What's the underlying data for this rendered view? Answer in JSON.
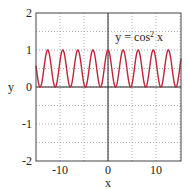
{
  "chart_data": {
    "type": "line",
    "title": "",
    "xlabel": "x",
    "ylabel": "y",
    "xlim": [
      -15,
      15.2
    ],
    "ylim": [
      -2,
      2
    ],
    "grid": true,
    "xticks": [
      -10,
      0,
      10
    ],
    "xtick_labels": [
      "-10",
      "0",
      "10"
    ],
    "xminor_ticks": [
      -15,
      -5,
      5,
      15
    ],
    "yticks": [
      -2,
      -1,
      0,
      1,
      2
    ],
    "ytick_labels": [
      "-2",
      "-1",
      "0",
      "1",
      "2"
    ],
    "yminor_ticks": [
      -1.5,
      -0.5,
      0.5,
      1.5
    ],
    "series": [
      {
        "name": "y = cos² x",
        "function": "cos(x)^2",
        "color": "#c0243a",
        "x_range": [
          -15,
          15.2
        ],
        "min": 0,
        "max": 1,
        "period": 3.14159
      }
    ],
    "annotations": [
      {
        "text": "y = cos² x",
        "x": 6.5,
        "y": 1.25
      }
    ],
    "legend": "none"
  },
  "colors": {
    "curve": "#c0243a",
    "axis": "#222222",
    "grid": "#9a9a9a",
    "frame": "#444444"
  }
}
